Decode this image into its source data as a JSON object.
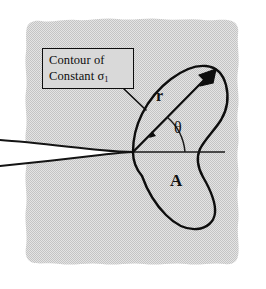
{
  "figure": {
    "width": 266,
    "height": 289
  },
  "callout": {
    "line1": "Contour of",
    "line2_prefix": "Constant ",
    "line2_symbol": "σ",
    "line2_subscript": "1",
    "full_text": "Contour of Constant σ1"
  },
  "annotations": {
    "radius_label": "r",
    "angle_label": "θ",
    "area_label": "A"
  },
  "colors": {
    "background": "#ffffff",
    "field_gray": "#d9d9d9",
    "contour_stroke": "#0d0d0d",
    "crack_stroke": "#141414",
    "axis_stroke": "#1a1a1a",
    "arrow_fill": "#0d0d0d",
    "text": "#0d0d0d",
    "crack_interior": "#ffffff"
  },
  "geometry": {
    "crack_tip_x": 133,
    "crack_tip_y": 152,
    "axis_line_end_x": 225,
    "arrow_tip_x": 216,
    "arrow_tip_y": 69,
    "angle_degrees": 48
  }
}
